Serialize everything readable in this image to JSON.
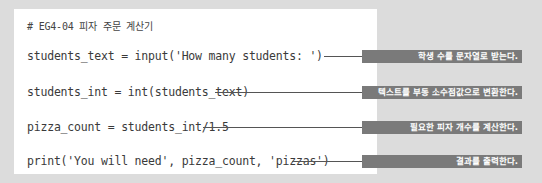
{
  "code": {
    "comment": "# EG4-04 피자 주문 계산기",
    "lines": [
      "students_text = input('How many students: ')",
      "students_int = int(students_text)",
      "pizza_count = students_int/1.5",
      "print('You will need', pizza_count, 'pizzas')"
    ]
  },
  "annotations": [
    "학생 수를 문자열로 받는다.",
    "텍스트를 부동 소수점값으로 변환한다.",
    "필요한 피자 개수를 계산한다.",
    "결과를 출력한다."
  ],
  "colors": {
    "background": "#dcdcdc",
    "code_box": "#ffffff",
    "label_bg": "#7a7a7a",
    "label_text": "#ffffff"
  }
}
